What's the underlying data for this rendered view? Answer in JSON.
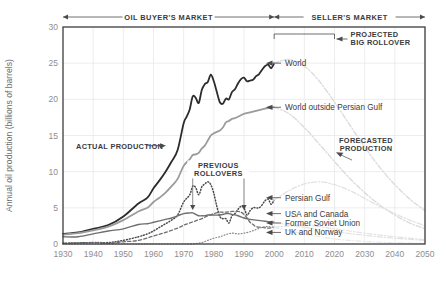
{
  "chart_data": {
    "type": "line",
    "title": "",
    "xlabel": "",
    "ylabel": "Annual oil production (billions of barrels)",
    "xlim": [
      1930,
      2050
    ],
    "ylim": [
      0,
      30
    ],
    "xticks": [
      "1930",
      "1940",
      "1950",
      "1960",
      "1970",
      "1980",
      "1990",
      "2000",
      "2010",
      "2020",
      "2030",
      "2040",
      "2050"
    ],
    "yticks": [
      "0",
      "5",
      "10",
      "15",
      "20",
      "25",
      "30"
    ],
    "grid": true,
    "legend_position": "inline-right-labels",
    "annotations": [
      {
        "name": "oil-buyers-market",
        "text": "OIL BUYER'S MARKET",
        "span": [
          1930,
          2000
        ]
      },
      {
        "name": "sellers-market",
        "text": "SELLER'S MARKET",
        "span": [
          2000,
          2050
        ]
      },
      {
        "name": "projected-big-rollover",
        "text": "PROJECTED BIG ROLLOVER",
        "span": [
          2000,
          2020
        ]
      },
      {
        "name": "previous-rollovers",
        "text": "PREVIOUS ROLLOVERS",
        "points": [
          1973,
          1990
        ]
      },
      {
        "name": "actual-production",
        "text": "ACTUAL PRODUCTION"
      },
      {
        "name": "forecasted-production",
        "text": "FORECASTED PRODUCTION"
      }
    ],
    "series": [
      {
        "name": "World",
        "label": "World",
        "color": "#2c2c2e",
        "style": "solid",
        "width": 1.8,
        "x": [
          1930,
          1935,
          1940,
          1945,
          1950,
          1955,
          1958,
          1960,
          1962,
          1964,
          1966,
          1968,
          1970,
          1971,
          1972,
          1973,
          1974,
          1975,
          1976,
          1977,
          1978,
          1979,
          1980,
          1981,
          1982,
          1983,
          1984,
          1985,
          1986,
          1987,
          1988,
          1989,
          1990,
          1991,
          1992,
          1993,
          1994,
          1995,
          1996,
          1997,
          1998,
          1999,
          2000
        ],
        "values": [
          1.4,
          1.6,
          2.1,
          2.6,
          3.8,
          5.6,
          6.4,
          7.7,
          8.8,
          10.0,
          11.4,
          13.0,
          16.7,
          17.6,
          18.6,
          20.4,
          20.2,
          19.5,
          21.3,
          22.1,
          22.4,
          23.4,
          22.5,
          21.0,
          19.6,
          19.4,
          20.1,
          20.0,
          21.0,
          21.4,
          22.2,
          22.8,
          23.0,
          22.5,
          22.6,
          22.7,
          23.2,
          23.5,
          24.1,
          24.6,
          24.8,
          24.3,
          25.0
        ]
      },
      {
        "name": "World outside Persian Gulf",
        "label": "World outside Persian Gulf",
        "color": "#9b9b9d",
        "style": "solid",
        "width": 1.8,
        "x": [
          1930,
          1935,
          1940,
          1945,
          1950,
          1955,
          1958,
          1960,
          1962,
          1964,
          1966,
          1968,
          1970,
          1972,
          1973,
          1974,
          1975,
          1976,
          1977,
          1978,
          1979,
          1980,
          1981,
          1982,
          1983,
          1984,
          1985,
          1986,
          1987,
          1988,
          1989,
          1990,
          1992,
          1994,
          1996,
          1998,
          2000
        ],
        "values": [
          1.3,
          1.5,
          1.9,
          2.4,
          3.3,
          4.5,
          5.0,
          5.8,
          6.4,
          7.1,
          8.0,
          9.0,
          10.8,
          11.7,
          12.3,
          12.4,
          12.6,
          13.2,
          13.6,
          14.3,
          15.0,
          15.3,
          15.5,
          15.7,
          16.1,
          16.8,
          17.0,
          17.3,
          17.4,
          17.6,
          17.8,
          18.0,
          18.2,
          18.4,
          18.6,
          18.8,
          18.9
        ]
      },
      {
        "name": "Persian Gulf",
        "label": "Persian Gulf",
        "color": "#4a4a4c",
        "style": "dotted",
        "width": 1.5,
        "x": [
          1930,
          1940,
          1945,
          1950,
          1955,
          1958,
          1960,
          1962,
          1964,
          1966,
          1968,
          1970,
          1972,
          1973,
          1974,
          1975,
          1976,
          1977,
          1978,
          1979,
          1980,
          1981,
          1982,
          1983,
          1984,
          1985,
          1986,
          1987,
          1988,
          1989,
          1990,
          1991,
          1992,
          1993,
          1994,
          1995,
          1996,
          1997,
          1998,
          1999,
          2000
        ],
        "values": [
          0.1,
          0.2,
          0.2,
          0.5,
          1.0,
          1.4,
          1.8,
          2.3,
          2.8,
          3.3,
          4.0,
          5.8,
          6.8,
          8.0,
          7.8,
          6.8,
          7.9,
          8.3,
          8.6,
          8.2,
          7.0,
          5.2,
          3.8,
          3.5,
          3.5,
          2.9,
          3.9,
          4.2,
          4.8,
          5.2,
          5.0,
          4.0,
          4.6,
          5.0,
          5.0,
          5.0,
          5.4,
          6.0,
          6.2,
          5.5,
          6.1
        ]
      },
      {
        "name": "USA and Canada",
        "label": "USA and Canada",
        "color": "#6e6e70",
        "style": "solid",
        "width": 1.4,
        "x": [
          1930,
          1935,
          1940,
          1945,
          1950,
          1955,
          1958,
          1960,
          1962,
          1964,
          1966,
          1968,
          1970,
          1972,
          1973,
          1974,
          1975,
          1976,
          1977,
          1978,
          1979,
          1980,
          1982,
          1984,
          1985,
          1986,
          1988,
          1990,
          1992,
          1994,
          1996,
          1998,
          2000
        ],
        "values": [
          1.0,
          1.0,
          1.4,
          1.8,
          2.1,
          2.7,
          2.8,
          3.0,
          3.2,
          3.4,
          3.6,
          3.9,
          4.2,
          4.3,
          4.3,
          4.1,
          3.9,
          3.9,
          3.9,
          4.0,
          4.0,
          4.0,
          4.0,
          4.2,
          4.2,
          4.1,
          3.9,
          3.6,
          3.4,
          3.3,
          3.2,
          3.1,
          3.0
        ]
      },
      {
        "name": "Former Soviet Union",
        "label": "Former Soviet Union",
        "color": "#6e6e70",
        "style": "dashed",
        "width": 1.3,
        "x": [
          1930,
          1940,
          1945,
          1950,
          1955,
          1960,
          1964,
          1968,
          1970,
          1972,
          1974,
          1976,
          1978,
          1980,
          1982,
          1984,
          1986,
          1988,
          1989,
          1990,
          1991,
          1992,
          1993,
          1994,
          1996,
          1998,
          2000
        ],
        "values": [
          0.1,
          0.2,
          0.1,
          0.3,
          0.5,
          1.1,
          1.6,
          2.2,
          2.6,
          2.9,
          3.2,
          3.5,
          3.9,
          4.2,
          4.4,
          4.4,
          4.5,
          4.5,
          4.4,
          4.1,
          3.6,
          3.0,
          2.7,
          2.4,
          2.3,
          2.2,
          2.3
        ]
      },
      {
        "name": "UK and Norway",
        "label": "UK and Norway",
        "color": "#8a8a8c",
        "style": "dotted",
        "width": 1.2,
        "x": [
          1930,
          1950,
          1960,
          1965,
          1970,
          1972,
          1974,
          1976,
          1978,
          1980,
          1982,
          1984,
          1986,
          1988,
          1990,
          1992,
          1994,
          1996,
          1998,
          2000
        ],
        "values": [
          0.0,
          0.0,
          0.0,
          0.0,
          0.0,
          0.0,
          0.05,
          0.2,
          0.5,
          0.8,
          1.0,
          1.3,
          1.5,
          1.4,
          1.5,
          1.7,
          2.0,
          2.3,
          2.4,
          2.3
        ]
      },
      {
        "name": "World forecast",
        "label": "",
        "color": "#dcdcdc",
        "style": "dashdot",
        "width": 1.4,
        "x": [
          2000,
          2005,
          2010,
          2015,
          2020,
          2025,
          2030,
          2035,
          2040,
          2045,
          2050
        ],
        "values": [
          25.0,
          25.5,
          24.6,
          22.5,
          19.6,
          16.5,
          13.4,
          10.6,
          8.2,
          6.2,
          4.6
        ]
      },
      {
        "name": "World outside Persian Gulf forecast",
        "label": "",
        "color": "#dcdcdc",
        "style": "dashdot",
        "width": 1.4,
        "x": [
          2000,
          2005,
          2010,
          2015,
          2020,
          2025,
          2030,
          2035,
          2040,
          2045,
          2050
        ],
        "values": [
          18.9,
          18.0,
          16.1,
          13.8,
          11.4,
          9.1,
          7.1,
          5.4,
          4.0,
          2.9,
          2.1
        ]
      },
      {
        "name": "Persian Gulf forecast",
        "label": "",
        "color": "#e2e2e2",
        "style": "dashdot",
        "width": 1.3,
        "x": [
          2000,
          2005,
          2010,
          2015,
          2020,
          2025,
          2030,
          2035,
          2040,
          2045,
          2050
        ],
        "values": [
          6.1,
          7.4,
          8.3,
          8.6,
          8.2,
          7.4,
          6.3,
          5.2,
          4.2,
          3.3,
          2.5
        ]
      },
      {
        "name": "USA and Canada forecast",
        "label": "",
        "color": "#e2e2e2",
        "style": "dashdot",
        "width": 1.2,
        "x": [
          2000,
          2010,
          2020,
          2030,
          2040,
          2050
        ],
        "values": [
          3.0,
          2.3,
          1.7,
          1.2,
          0.8,
          0.5
        ]
      },
      {
        "name": "Former Soviet Union forecast",
        "label": "",
        "color": "#e2e2e2",
        "style": "dashdot",
        "width": 1.2,
        "x": [
          2000,
          2010,
          2020,
          2030,
          2040,
          2050
        ],
        "values": [
          2.3,
          2.6,
          2.1,
          1.5,
          1.0,
          0.6
        ]
      },
      {
        "name": "UK and Norway forecast",
        "label": "",
        "color": "#e8e8e8",
        "style": "dashdot",
        "width": 1.1,
        "x": [
          2000,
          2010,
          2020,
          2030,
          2040,
          2050
        ],
        "values": [
          2.3,
          1.4,
          0.7,
          0.35,
          0.18,
          0.1
        ]
      }
    ]
  }
}
